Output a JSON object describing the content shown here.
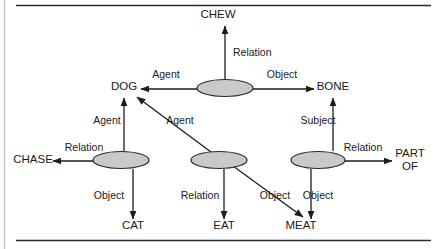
{
  "figure": {
    "kind": "semantic-network-diagram",
    "background_color": "#ffffff",
    "relation_node_fill": "#c9c9c9",
    "relation_node_stroke": "#2a2a2a",
    "line_color": "#1c1c1c",
    "text_color": "#1a1a1a",
    "rules": {
      "top_rule": true,
      "bottom_rule": true,
      "left_gutter_rule": true
    }
  },
  "concepts": [
    {
      "id": "chew",
      "label": "CHEW",
      "x": 218,
      "y": 18,
      "anchor": "middle",
      "lines": [
        "CHEW"
      ]
    },
    {
      "id": "dog",
      "label": "DOG",
      "x": 124,
      "y": 90,
      "anchor": "middle",
      "lines": [
        "DOG"
      ]
    },
    {
      "id": "bone",
      "label": "BONE",
      "x": 333,
      "y": 90,
      "anchor": "middle",
      "lines": [
        "BONE"
      ]
    },
    {
      "id": "chase",
      "label": "CHASE",
      "x": 33,
      "y": 163,
      "anchor": "middle",
      "lines": [
        "CHASE"
      ]
    },
    {
      "id": "part-of",
      "label": "PART OF",
      "x": 410,
      "y": 157,
      "anchor": "middle",
      "lines": [
        "PART",
        "OF"
      ]
    },
    {
      "id": "cat",
      "label": "CAT",
      "x": 133,
      "y": 229,
      "anchor": "middle",
      "lines": [
        "CAT"
      ]
    },
    {
      "id": "eat",
      "label": "EAT",
      "x": 224,
      "y": 229,
      "anchor": "middle",
      "lines": [
        "EAT"
      ]
    },
    {
      "id": "meat",
      "label": "MEAT",
      "x": 301,
      "y": 229,
      "anchor": "middle",
      "lines": [
        "MEAT"
      ]
    }
  ],
  "relation_nodes": [
    {
      "id": "chew-relation",
      "cx": 225,
      "cy": 88,
      "rx": 28,
      "ry": 8.5
    },
    {
      "id": "chase-relation",
      "cx": 121,
      "cy": 160,
      "rx": 28,
      "ry": 8.5
    },
    {
      "id": "eat-relation",
      "cx": 219,
      "cy": 160,
      "rx": 28,
      "ry": 8.5
    },
    {
      "id": "partof-relation",
      "cx": 318,
      "cy": 160,
      "rx": 27,
      "ry": 8.5
    }
  ],
  "edges": [
    {
      "id": "chew-relation-to-chew",
      "label": "Relation",
      "from": "chew-relation",
      "to": "chew",
      "label_x": 233,
      "label_y": 56,
      "label_anchor": "start",
      "x1": 225,
      "y1": 79,
      "x2": 225,
      "y2": 26
    },
    {
      "id": "chew-relation-to-dog",
      "label": "Agent",
      "from": "chew-relation",
      "to": "dog",
      "label_x": 166,
      "label_y": 78,
      "label_anchor": "middle",
      "x1": 197,
      "y1": 89,
      "x2": 141,
      "y2": 89
    },
    {
      "id": "chew-relation-to-bone",
      "label": "Object",
      "from": "chew-relation",
      "to": "bone",
      "label_x": 282,
      "label_y": 78,
      "label_anchor": "middle",
      "x1": 253,
      "y1": 89,
      "x2": 314,
      "y2": 89
    },
    {
      "id": "chase-relation-to-dog",
      "label": "Agent",
      "from": "chase-relation",
      "to": "dog",
      "label_x": 107,
      "label_y": 124,
      "label_anchor": "middle",
      "x1": 124,
      "y1": 151,
      "x2": 124,
      "y2": 98
    },
    {
      "id": "chase-relation-to-chase",
      "label": "Relation",
      "from": "chase-relation",
      "to": "chase",
      "label_x": 84,
      "label_y": 151,
      "label_anchor": "middle",
      "x1": 93,
      "y1": 161,
      "x2": 53,
      "y2": 161
    },
    {
      "id": "chase-relation-to-cat",
      "label": "Object",
      "from": "chase-relation",
      "to": "cat",
      "label_x": 109,
      "label_y": 199,
      "label_anchor": "middle",
      "x1": 133,
      "y1": 169,
      "x2": 133,
      "y2": 219
    },
    {
      "id": "eat-relation-to-dog",
      "label": "Agent",
      "from": "eat-relation",
      "to": "dog",
      "label_x": 180,
      "label_y": 124,
      "label_anchor": "middle",
      "x1": 211,
      "y1": 152,
      "x2": 137,
      "y2": 97
    },
    {
      "id": "eat-relation-to-eat",
      "label": "Relation",
      "from": "eat-relation",
      "to": "eat",
      "label_x": 200,
      "label_y": 199,
      "label_anchor": "middle",
      "x1": 224,
      "y1": 169,
      "x2": 224,
      "y2": 219
    },
    {
      "id": "eat-relation-to-meat",
      "label": "Object",
      "from": "eat-relation",
      "to": "meat",
      "label_x": 275,
      "label_y": 199,
      "label_anchor": "middle",
      "x1": 233,
      "y1": 166,
      "x2": 303,
      "y2": 217
    },
    {
      "id": "partof-relation-to-bone",
      "label": "Subject",
      "from": "partof-relation",
      "to": "bone",
      "label_x": 318,
      "label_y": 124,
      "label_anchor": "middle",
      "x1": 333,
      "y1": 151,
      "x2": 333,
      "y2": 98
    },
    {
      "id": "partof-relation-to-partof",
      "label": "Relation",
      "from": "partof-relation",
      "to": "part-of",
      "label_x": 363,
      "label_y": 151,
      "label_anchor": "middle",
      "x1": 345,
      "y1": 161,
      "x2": 392,
      "y2": 161
    },
    {
      "id": "partof-relation-to-meat",
      "label": "Object",
      "from": "partof-relation",
      "to": "meat",
      "label_x": 318,
      "label_y": 199,
      "label_anchor": "middle",
      "x1": 311,
      "y1": 169,
      "x2": 311,
      "y2": 219
    }
  ]
}
